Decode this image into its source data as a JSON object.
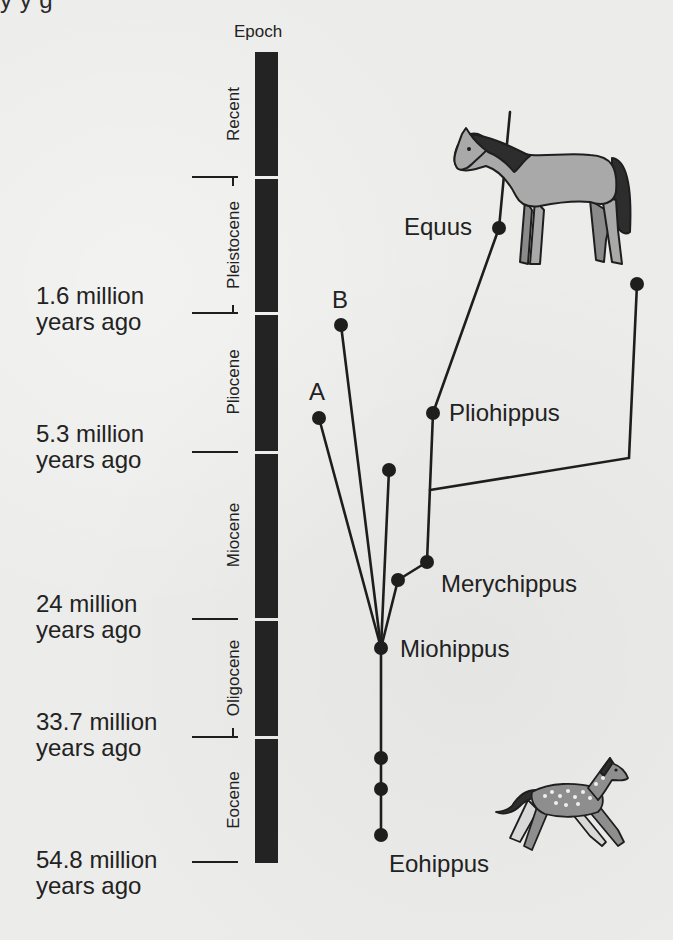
{
  "page_header_fragment": "y                                                              y                                 g",
  "timeline": {
    "title": "Epoch",
    "epochs": [
      {
        "name": "Recent",
        "top": 52,
        "bottom": 177
      },
      {
        "name": "Pleistocene",
        "top": 177,
        "bottom": 313
      },
      {
        "name": "Pliocene",
        "top": 313,
        "bottom": 452
      },
      {
        "name": "Miocene",
        "top": 452,
        "bottom": 619
      },
      {
        "name": "Oligocene",
        "top": 619,
        "bottom": 737
      },
      {
        "name": "Eocene",
        "top": 737,
        "bottom": 862
      }
    ],
    "ages": [
      {
        "line1": "1.6 million",
        "line2": "years ago",
        "y": 313
      },
      {
        "line1": "5.3 million",
        "line2": "years ago",
        "y": 452
      },
      {
        "line1": "24 million",
        "line2": "years ago",
        "y": 619
      },
      {
        "line1": "33.7 million",
        "line2": "years ago",
        "y": 737
      },
      {
        "line1": "54.8 million",
        "line2": "years ago",
        "y": 862
      }
    ]
  },
  "tree": {
    "taxa": [
      {
        "label": "Equus",
        "x": 499,
        "y": 228
      },
      {
        "label": "Pliohippus",
        "x": 433,
        "y": 413
      },
      {
        "label": "Merychippus",
        "x": 427,
        "y": 562
      },
      {
        "label": "Miohippus",
        "x": 381,
        "y": 648
      },
      {
        "label": "Eohippus",
        "x": 381,
        "y": 835
      }
    ],
    "unknown_branches": [
      {
        "label": "A",
        "x": 319,
        "y": 418
      },
      {
        "label": "B",
        "x": 341,
        "y": 325
      }
    ],
    "colors": {
      "line": "#1e1e1e",
      "node": "#1e1e1e",
      "epoch_bar": "#232323",
      "horse_body": "#a9a9a9",
      "horse_mane": "#2d2d2d",
      "eohippus_body": "#8e8e8e"
    }
  },
  "illustrations": {
    "modern_horse": "modern-horse-illustration",
    "eohippus": "eohippus-illustration"
  }
}
